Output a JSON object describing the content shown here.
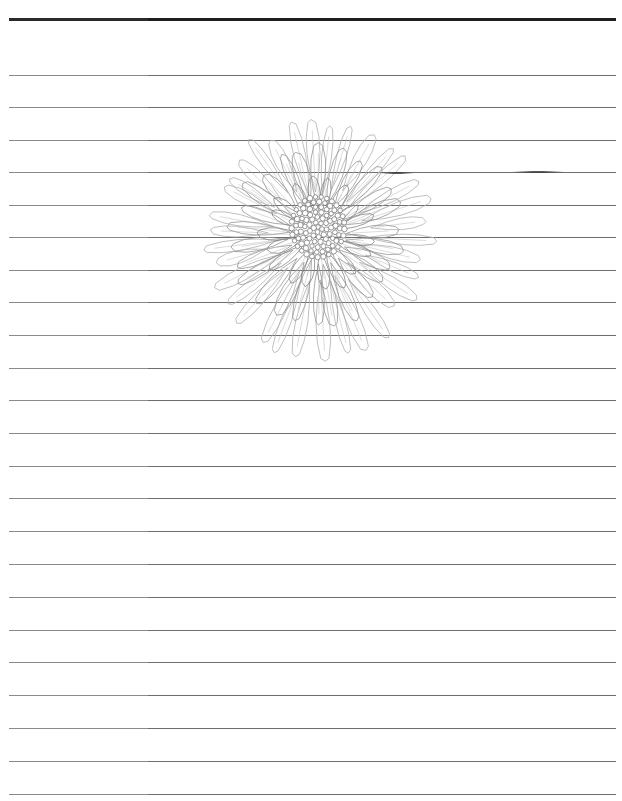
{
  "page": {
    "type": "lined-writing-paper",
    "background_color": "#ffffff",
    "rule_color": "#6e6e6e",
    "header_rule_color": "#1e1e1e",
    "header_rule_y": 19,
    "rule_ys": [
      75,
      107,
      140,
      172,
      205,
      237,
      270,
      302,
      335,
      368,
      400,
      433,
      466,
      498,
      531,
      564,
      597,
      630,
      662,
      695,
      728,
      761,
      794
    ],
    "rule_left": 9,
    "rule_right": 616,
    "line_spacing": 32.7
  },
  "illustration": {
    "subject": "chrysanthemum-line-drawing",
    "style": "pencil sketch",
    "stroke_color": "#8c8c8c",
    "center": [
      318,
      235
    ]
  }
}
